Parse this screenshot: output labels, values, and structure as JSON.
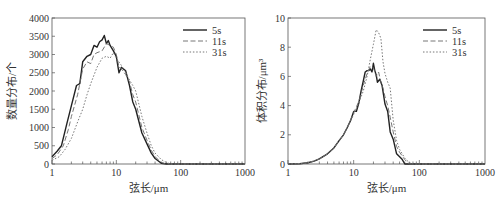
{
  "chart_data": [
    {
      "type": "line",
      "xscale": "log",
      "xlabel": "弦长/μm",
      "ylabel": "数量分布/个",
      "xlim": [
        1,
        1000
      ],
      "ylim": [
        0,
        4000
      ],
      "xticks": [
        "1",
        "10",
        "100",
        "1000"
      ],
      "yticks": [
        "0",
        "500",
        "1000",
        "1500",
        "2000",
        "2500",
        "3000",
        "3500",
        "4000"
      ],
      "legend": [
        "5s",
        "11s",
        "31s"
      ],
      "legend_position": "upper right",
      "grid": false,
      "series": [
        {
          "name": "5s",
          "style": "solid",
          "x": [
            1,
            1.2,
            1.4,
            1.7,
            2,
            2.4,
            2.7,
            3,
            3.5,
            4,
            4.5,
            5,
            5.5,
            6,
            6.5,
            7,
            7.5,
            8,
            9,
            10,
            11,
            12,
            14,
            16,
            18,
            20,
            25,
            30,
            35,
            40,
            50,
            60,
            100,
            1000
          ],
          "y": [
            200,
            350,
            500,
            1100,
            1600,
            2150,
            2200,
            2800,
            2950,
            3000,
            3250,
            3200,
            3350,
            3400,
            3520,
            3300,
            3380,
            3250,
            3100,
            2950,
            2500,
            2650,
            2550,
            2150,
            1700,
            1500,
            850,
            550,
            300,
            150,
            20,
            0,
            0,
            0
          ]
        },
        {
          "name": "11s",
          "style": "dashed",
          "x": [
            1,
            1.2,
            1.5,
            1.8,
            2,
            2.5,
            3,
            3.5,
            4,
            4.5,
            5,
            6,
            7,
            8,
            9,
            10,
            11,
            12,
            14,
            16,
            18,
            20,
            25,
            30,
            35,
            40,
            50,
            60,
            100,
            1000
          ],
          "y": [
            150,
            250,
            500,
            950,
            1300,
            1900,
            2600,
            2800,
            2750,
            3000,
            3050,
            3100,
            3300,
            3250,
            3200,
            3000,
            2650,
            2600,
            2450,
            2250,
            1900,
            1700,
            1000,
            650,
            380,
            200,
            40,
            0,
            0,
            0
          ]
        },
        {
          "name": "31s",
          "style": "dotted",
          "x": [
            1,
            1.3,
            1.6,
            2,
            2.5,
            3,
            3.5,
            4,
            5,
            6,
            7,
            8,
            9,
            10,
            12,
            14,
            16,
            18,
            20,
            25,
            30,
            35,
            40,
            50,
            60,
            70,
            100,
            1000
          ],
          "y": [
            100,
            200,
            400,
            700,
            1150,
            1500,
            1900,
            2200,
            2650,
            2900,
            2950,
            2900,
            3050,
            2900,
            2700,
            2500,
            2300,
            2150,
            2000,
            1300,
            850,
            500,
            300,
            120,
            40,
            0,
            0,
            0
          ]
        }
      ]
    },
    {
      "type": "line",
      "xscale": "log",
      "xlabel": "弦长/μm",
      "ylabel": "体积分布/μm³",
      "xlim": [
        1,
        1000
      ],
      "ylim": [
        0,
        10
      ],
      "xticks": [
        "1",
        "10",
        "100",
        "1000"
      ],
      "yticks": [
        "0",
        "2",
        "4",
        "6",
        "8",
        "10"
      ],
      "legend": [
        "5s",
        "11s",
        "31s"
      ],
      "legend_position": "upper right",
      "grid": false,
      "series": [
        {
          "name": "5s",
          "style": "solid",
          "x": [
            1,
            1.5,
            2,
            2.5,
            3,
            4,
            5,
            6,
            7,
            8,
            9,
            10,
            11,
            12,
            13,
            14,
            15,
            16,
            17,
            18,
            19,
            20,
            21,
            22,
            23,
            25,
            27,
            30,
            33,
            36,
            40,
            45,
            50,
            55,
            60,
            100,
            1000
          ],
          "y": [
            0,
            0.02,
            0.08,
            0.2,
            0.35,
            0.7,
            1.1,
            1.6,
            2.0,
            2.5,
            3.0,
            3.6,
            3.6,
            4.2,
            5.0,
            5.7,
            6.3,
            6.4,
            6.4,
            6.5,
            6.3,
            6.9,
            6.4,
            6.1,
            5.6,
            5.8,
            5.4,
            4.1,
            3.6,
            2.2,
            1.7,
            0.7,
            0.5,
            0.3,
            0,
            0,
            0
          ]
        },
        {
          "name": "11s",
          "style": "dashed",
          "x": [
            1,
            1.5,
            2,
            2.5,
            3,
            4,
            5,
            6,
            7,
            8,
            10,
            12,
            14,
            16,
            18,
            20,
            22,
            24,
            26,
            28,
            30,
            33,
            36,
            40,
            45,
            50,
            60,
            70,
            100,
            1000
          ],
          "y": [
            0,
            0.02,
            0.08,
            0.2,
            0.35,
            0.7,
            1.1,
            1.6,
            2.0,
            2.5,
            3.5,
            4.3,
            5.4,
            6.2,
            6.7,
            6.6,
            6.0,
            6.3,
            5.6,
            5.2,
            4.6,
            4.0,
            3.2,
            2.2,
            1.2,
            0.8,
            0.3,
            0,
            0,
            0
          ]
        },
        {
          "name": "31s",
          "style": "dotted",
          "x": [
            1,
            1.5,
            2,
            2.5,
            3,
            4,
            5,
            6,
            7,
            8,
            10,
            12,
            14,
            16,
            18,
            20,
            22,
            24,
            26,
            28,
            30,
            33,
            36,
            40,
            45,
            50,
            60,
            70,
            80,
            100,
            1000
          ],
          "y": [
            0,
            0.02,
            0.08,
            0.2,
            0.35,
            0.7,
            1.1,
            1.6,
            2.0,
            2.5,
            3.4,
            4.2,
            5.0,
            6.0,
            7.2,
            8.2,
            9.2,
            9.0,
            8.6,
            7.0,
            6.2,
            5.6,
            5.2,
            3.0,
            1.6,
            1.0,
            0.4,
            0.1,
            0,
            0,
            0
          ]
        }
      ]
    }
  ]
}
